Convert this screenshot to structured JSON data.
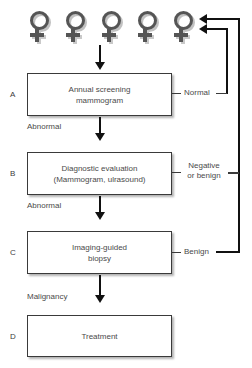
{
  "diagram": {
    "type": "flowchart",
    "colors": {
      "box_border": "#3a3a3a",
      "box_fill": "#ffffff",
      "text": "#4a4a4a",
      "connector": "#111111",
      "symbol": "#555555"
    }
  },
  "patients": {
    "icon": "female-symbol-icon",
    "count": 5,
    "count_label": "5",
    "items": [
      {
        "label": "female-symbol-1"
      },
      {
        "label": "female-symbol-2"
      },
      {
        "label": "female-symbol-3"
      },
      {
        "label": "female-symbol-4"
      },
      {
        "label": "female-symbol-5"
      }
    ]
  },
  "panels": [
    {
      "letter": "A",
      "text": "Annual screening\nmammogram"
    },
    {
      "letter": "B",
      "text": "Diagnostic evaluation\n(Mammogram, ulrasound)"
    },
    {
      "letter": "C",
      "text": "Imaging-guided\nbiopsy"
    },
    {
      "letter": "D",
      "text": "Treatment"
    }
  ],
  "flow_labels": {
    "abnormal_a_to_b": "Abnormal",
    "abnormal_b_to_c": "Abnormal",
    "malignancy_c_to_d": "Malignancy",
    "normal_a": "Normal",
    "negative_or_benign_b": "Negative\nor benign",
    "benign_c": "Benign"
  }
}
